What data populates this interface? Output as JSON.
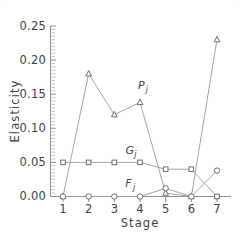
{
  "figure": {
    "background": "#ffffff",
    "artifact_top_left": "..",
    "artifact_top_right": "....."
  },
  "axes": {
    "y": {
      "title": "Elasticity",
      "ticks": [
        "0.00",
        "0.05",
        "0.10",
        "0.15",
        "0.20",
        "0.25"
      ],
      "min": 0.0,
      "max": 0.25,
      "minor_tick_step": 0.005
    },
    "x": {
      "title": "Stage",
      "ticks": [
        "1",
        "2",
        "3",
        "4",
        "5",
        "6",
        "7"
      ],
      "min": 1,
      "max": 7
    }
  },
  "series_labels": {
    "p": {
      "base": "P",
      "sub": "j"
    },
    "g": {
      "base": "G",
      "sub": "j"
    },
    "f": {
      "base": "F",
      "sub": "j"
    }
  },
  "colors": {
    "axis": "#8e8e8e",
    "line": "#9a9a9a",
    "marker_stroke": "#5e5e5e",
    "marker_fill": "#ffffff",
    "text": "#3f3f3f"
  },
  "chart_data": {
    "type": "line",
    "title": "",
    "xlabel": "Stage",
    "ylabel": "Elasticity",
    "x": [
      1,
      2,
      3,
      4,
      5,
      6,
      7
    ],
    "xlim": [
      1,
      7
    ],
    "ylim": [
      0.0,
      0.25
    ],
    "grid": false,
    "legend": "inline-annotations",
    "series": [
      {
        "name": "Pj",
        "marker": "triangle",
        "label_x": 4.05,
        "label_y": 0.158,
        "values": [
          0.0,
          0.18,
          0.12,
          0.138,
          0.005,
          0.0,
          0.23
        ]
      },
      {
        "name": "Gj",
        "marker": "square",
        "label_x": 3.6,
        "label_y": 0.062,
        "values": [
          0.05,
          0.05,
          0.05,
          0.05,
          0.04,
          0.04,
          0.0
        ]
      },
      {
        "name": "Fj",
        "marker": "circle",
        "label_x": 3.55,
        "label_y": 0.014,
        "values": [
          0.0,
          0.0,
          0.0,
          0.0,
          0.012,
          0.0,
          0.038
        ]
      }
    ]
  }
}
